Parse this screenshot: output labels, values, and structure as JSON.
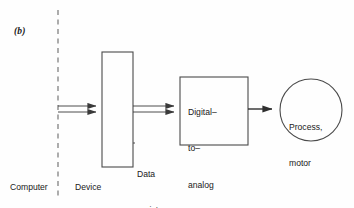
{
  "figure": {
    "panel_label": "(b)",
    "background_color": "#fefefe",
    "stroke_color": "#3a3a3a"
  },
  "nodes": {
    "data_register": {
      "shape": "rectangle",
      "caption_line1": "Data",
      "caption_line2": "register",
      "x": 102,
      "y": 52,
      "width": 31,
      "height": 115
    },
    "dac": {
      "shape": "rectangle",
      "label_line1": "Digital–",
      "label_line2": "to–",
      "label_line3": "analog",
      "label_line4": "convertor",
      "x": 180,
      "y": 77,
      "width": 68,
      "height": 68
    },
    "process": {
      "shape": "circle",
      "label_line1": "Process,",
      "label_line2": "motor",
      "cx": 311,
      "cy": 110,
      "r": 31
    }
  },
  "divider": {
    "style": "dashed-vertical",
    "x": 58,
    "y_top": 10,
    "y_bottom": 196
  },
  "zone_labels": {
    "left": "Computer",
    "right": "Device"
  },
  "connectors": [
    {
      "name": "computer-to-register",
      "style": "double-line-arrow",
      "from_x": 58,
      "to_x": 102,
      "y": 109
    },
    {
      "name": "register-to-dac",
      "style": "double-line-arrow",
      "from_x": 133,
      "to_x": 180,
      "y": 109
    },
    {
      "name": "dac-to-process",
      "style": "single-line-arrow",
      "from_x": 248,
      "to_x": 280,
      "y": 109
    }
  ]
}
